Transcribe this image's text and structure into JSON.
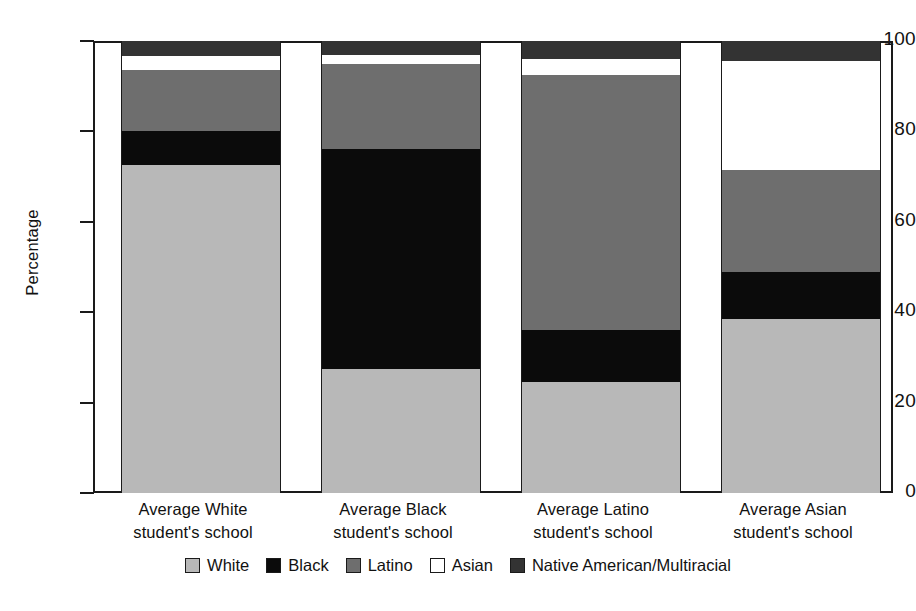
{
  "chart_data": {
    "type": "bar",
    "subtype": "stacked-bar-100",
    "title": "",
    "xlabel": "",
    "ylabel": "Percentage",
    "ylim": [
      0,
      100
    ],
    "yticks": [
      0,
      20,
      40,
      60,
      80,
      100
    ],
    "ytick_labels": [
      "0",
      "20",
      "40",
      "60",
      "80",
      "100"
    ],
    "grid": false,
    "legend_position": "bottom",
    "categories": [
      "Average White student's school",
      "Average Black student's school",
      "Average Latino student's school",
      "Average Asian student's school"
    ],
    "category_lines": [
      [
        "Average White",
        "student's school"
      ],
      [
        "Average Black",
        "student's school"
      ],
      [
        "Average Latino",
        "student's school"
      ],
      [
        "Average Asian",
        "student's school"
      ]
    ],
    "series": [
      {
        "name": "White",
        "color": "#b8b8b8",
        "values": [
          72.5,
          27.5,
          24.5,
          38.5
        ]
      },
      {
        "name": "Black",
        "color": "#0b0b0b",
        "values": [
          7.5,
          48.5,
          11.5,
          10.5
        ]
      },
      {
        "name": "Latino",
        "color": "#6e6e6e",
        "values": [
          13.5,
          19.0,
          56.5,
          22.5
        ]
      },
      {
        "name": "Asian",
        "color": "#ffffff",
        "values": [
          3.2,
          2.0,
          3.5,
          24.0
        ]
      },
      {
        "name": "Native American/Multiracial",
        "color": "#333333",
        "values": [
          3.3,
          3.0,
          4.0,
          4.5
        ]
      }
    ]
  },
  "legend": {
    "items": [
      {
        "label": "White",
        "color": "#b8b8b8"
      },
      {
        "label": "Black",
        "color": "#0b0b0b"
      },
      {
        "label": "Latino",
        "color": "#6e6e6e"
      },
      {
        "label": "Asian",
        "color": "#ffffff"
      },
      {
        "label": "Native American/Multiracial",
        "color": "#333333"
      }
    ]
  }
}
